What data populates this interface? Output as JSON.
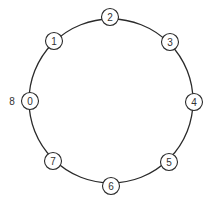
{
  "diagram": {
    "type": "ring",
    "ring": {
      "cx": 111,
      "cy": 101,
      "r": 82,
      "stroke": "#2a2a2a"
    },
    "node_radius": 8.5,
    "nodes": [
      {
        "id": "0",
        "label": "0",
        "cx": 30,
        "cy": 101
      },
      {
        "id": "1",
        "label": "1",
        "cx": 54,
        "cy": 41
      },
      {
        "id": "2",
        "label": "2",
        "cx": 110,
        "cy": 17
      },
      {
        "id": "3",
        "label": "3",
        "cx": 170,
        "cy": 42
      },
      {
        "id": "4",
        "label": "4",
        "cx": 194,
        "cy": 102
      },
      {
        "id": "5",
        "label": "5",
        "cx": 169,
        "cy": 162
      },
      {
        "id": "6",
        "label": "6",
        "cx": 111,
        "cy": 186
      },
      {
        "id": "7",
        "label": "7",
        "cx": 53,
        "cy": 161
      }
    ],
    "outer_labels": [
      {
        "text": "8",
        "x": 12,
        "y": 101,
        "attached_to": "0"
      }
    ]
  }
}
